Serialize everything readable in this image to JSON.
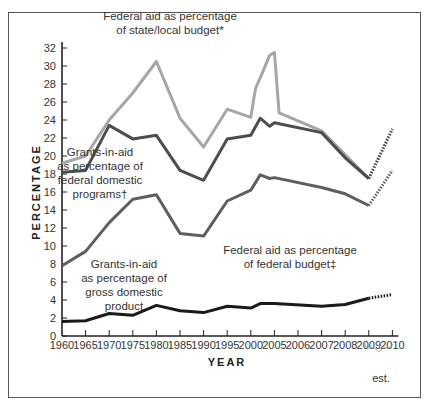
{
  "chart_data": {
    "type": "line",
    "title": "",
    "xlabel": "YEAR",
    "ylabel": "PERCENTAGE",
    "ylim": [
      0,
      32
    ],
    "yticks": [
      0,
      2,
      4,
      6,
      8,
      10,
      12,
      14,
      16,
      18,
      20,
      22,
      24,
      26,
      28,
      30,
      32
    ],
    "x_tick_labels": [
      "1960",
      "1965",
      "1970",
      "1975",
      "1980",
      "1985",
      "1990",
      "1995",
      "2000",
      "2005",
      "2006",
      "2007",
      "2008",
      "2009",
      "2010"
    ],
    "estimate_note": "est.",
    "estimate_range": [
      "2009",
      "2010"
    ],
    "grid": false,
    "series": [
      {
        "name": "Federal aid as percentage of state/local budget*",
        "label_lines": [
          "Federal aid as percentage",
          "of state/local budget*"
        ],
        "color": "#a6a6a6",
        "points": [
          {
            "x": 0,
            "y": 19.2
          },
          {
            "x": 1,
            "y": 20.0
          },
          {
            "x": 2,
            "y": 24.0
          },
          {
            "x": 3,
            "y": 27.0
          },
          {
            "x": 4,
            "y": 30.5
          },
          {
            "x": 5,
            "y": 24.2
          },
          {
            "x": 6,
            "y": 21.0
          },
          {
            "x": 7,
            "y": 25.2
          },
          {
            "x": 8,
            "y": 24.3
          },
          {
            "x": 8.2,
            "y": 27.5
          },
          {
            "x": 8.5,
            "y": 29.3
          },
          {
            "x": 8.8,
            "y": 31.2
          },
          {
            "x": 9,
            "y": 31.5
          },
          {
            "x": 9.2,
            "y": 24.8
          },
          {
            "x": 11,
            "y": 22.8
          },
          {
            "x": 13,
            "y": 17.5
          }
        ],
        "estimate": [
          {
            "x": 13,
            "y": 17.5
          },
          {
            "x": 14,
            "y": 23.0
          }
        ]
      },
      {
        "name": "Grants-in-aid as percentage of federal domestic programs†",
        "label_lines": [
          "Grants-in-aid",
          "as percentage of",
          "federal domestic",
          "programs†"
        ],
        "color": "#4d4d4d",
        "points": [
          {
            "x": 0,
            "y": 18.2
          },
          {
            "x": 1,
            "y": 18.4
          },
          {
            "x": 2,
            "y": 23.4
          },
          {
            "x": 3,
            "y": 21.9
          },
          {
            "x": 4,
            "y": 22.3
          },
          {
            "x": 5,
            "y": 18.4
          },
          {
            "x": 6,
            "y": 17.3
          },
          {
            "x": 7,
            "y": 21.9
          },
          {
            "x": 8,
            "y": 22.3
          },
          {
            "x": 8.4,
            "y": 24.2
          },
          {
            "x": 8.8,
            "y": 23.3
          },
          {
            "x": 9,
            "y": 23.7
          },
          {
            "x": 11,
            "y": 22.6
          },
          {
            "x": 12,
            "y": 19.8
          },
          {
            "x": 13,
            "y": 17.5
          }
        ],
        "estimate": [
          {
            "x": 13,
            "y": 17.5
          },
          {
            "x": 14,
            "y": 23.0
          }
        ]
      },
      {
        "name": "Federal aid as percentage of federal budget‡",
        "label_lines": [
          "Federal aid as percentage",
          "of federal budget‡"
        ],
        "color": "#5e5e5e",
        "points": [
          {
            "x": 0,
            "y": 7.8
          },
          {
            "x": 1,
            "y": 9.4
          },
          {
            "x": 2,
            "y": 12.6
          },
          {
            "x": 3,
            "y": 15.2
          },
          {
            "x": 4,
            "y": 15.7
          },
          {
            "x": 5,
            "y": 11.4
          },
          {
            "x": 6,
            "y": 11.1
          },
          {
            "x": 7,
            "y": 15.0
          },
          {
            "x": 8,
            "y": 16.2
          },
          {
            "x": 8.4,
            "y": 17.9
          },
          {
            "x": 8.8,
            "y": 17.5
          },
          {
            "x": 9,
            "y": 17.6
          },
          {
            "x": 11,
            "y": 16.5
          },
          {
            "x": 12,
            "y": 15.8
          },
          {
            "x": 13,
            "y": 14.5
          }
        ],
        "estimate": [
          {
            "x": 13,
            "y": 14.5
          },
          {
            "x": 14,
            "y": 18.4
          }
        ]
      },
      {
        "name": "Grants-in-aid as percentage of gross domestic product",
        "label_lines": [
          "Grants-in-aid",
          "as percentage of",
          "gross domestic",
          "product"
        ],
        "color": "#1a1a1a",
        "points": [
          {
            "x": 0,
            "y": 1.6
          },
          {
            "x": 1,
            "y": 1.7
          },
          {
            "x": 2,
            "y": 2.5
          },
          {
            "x": 3,
            "y": 2.3
          },
          {
            "x": 4,
            "y": 3.4
          },
          {
            "x": 5,
            "y": 2.8
          },
          {
            "x": 6,
            "y": 2.6
          },
          {
            "x": 7,
            "y": 3.3
          },
          {
            "x": 8,
            "y": 3.1
          },
          {
            "x": 8.4,
            "y": 3.6
          },
          {
            "x": 9,
            "y": 3.6
          },
          {
            "x": 11,
            "y": 3.3
          },
          {
            "x": 12,
            "y": 3.5
          },
          {
            "x": 13,
            "y": 4.2
          }
        ],
        "estimate": [
          {
            "x": 13,
            "y": 4.2
          },
          {
            "x": 14,
            "y": 4.6
          }
        ]
      }
    ]
  }
}
